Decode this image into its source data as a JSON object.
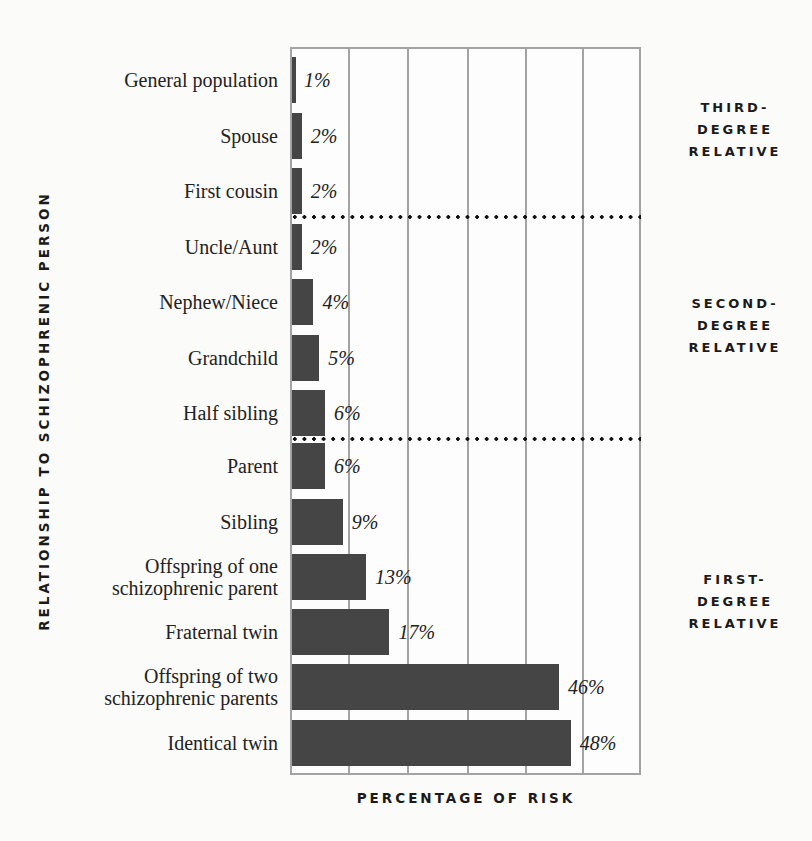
{
  "chart_data": {
    "type": "bar",
    "orientation": "horizontal",
    "title": "",
    "xlabel": "PERCENTAGE OF RISK",
    "ylabel": "RELATIONSHIP TO SCHIZOPHRENIC PERSON",
    "xlim": [
      0,
      60
    ],
    "grid": {
      "vertical": true,
      "step": 10
    },
    "categories": [
      "General population",
      "Spouse",
      "First cousin",
      "Uncle/Aunt",
      "Nephew/Niece",
      "Grandchild",
      "Half sibling",
      "Parent",
      "Sibling",
      "Offspring of one schizophrenic parent",
      "Fraternal twin",
      "Offspring of two schizophrenic parents",
      "Identical twin"
    ],
    "values": [
      1,
      2,
      2,
      2,
      4,
      5,
      6,
      6,
      9,
      13,
      17,
      46,
      48
    ],
    "value_labels": [
      "1%",
      "2%",
      "2%",
      "2%",
      "4%",
      "5%",
      "6%",
      "6%",
      "9%",
      "13%",
      "17%",
      "46%",
      "48%"
    ],
    "groups": [
      {
        "label": "THIRD-DEGREE RELATIVE",
        "categories": [
          "General population",
          "Spouse",
          "First cousin"
        ]
      },
      {
        "label": "SECOND-DEGREE RELATIVE",
        "categories": [
          "Uncle/Aunt",
          "Nephew/Niece",
          "Grandchild",
          "Half sibling"
        ]
      },
      {
        "label": "FIRST-DEGREE RELATIVE",
        "categories": [
          "Parent",
          "Sibling",
          "Offspring of one schizophrenic parent",
          "Fraternal twin",
          "Offspring of two schizophrenic parents",
          "Identical twin"
        ]
      }
    ],
    "legend": null
  },
  "axes": {
    "x_title": "PERCENTAGE OF RISK",
    "y_title": "RELATIONSHIP TO SCHIZOPHRENIC PERSON"
  },
  "rows": [
    {
      "lines": [
        "General population"
      ],
      "value": "1%"
    },
    {
      "lines": [
        "Spouse"
      ],
      "value": "2%"
    },
    {
      "lines": [
        "First cousin"
      ],
      "value": "2%"
    },
    {
      "lines": [
        "Uncle/Aunt"
      ],
      "value": "2%"
    },
    {
      "lines": [
        "Nephew/Niece"
      ],
      "value": "4%"
    },
    {
      "lines": [
        "Grandchild"
      ],
      "value": "5%"
    },
    {
      "lines": [
        "Half sibling"
      ],
      "value": "6%"
    },
    {
      "lines": [
        "Parent"
      ],
      "value": "6%"
    },
    {
      "lines": [
        "Sibling"
      ],
      "value": "9%"
    },
    {
      "lines": [
        "Offspring of one",
        "schizophrenic parent"
      ],
      "value": "13%"
    },
    {
      "lines": [
        "Fraternal twin"
      ],
      "value": "17%"
    },
    {
      "lines": [
        "Offspring of two",
        "schizophrenic parents"
      ],
      "value": "46%"
    },
    {
      "lines": [
        "Identical twin"
      ],
      "value": "48%"
    }
  ],
  "group_labels": {
    "third": [
      "THIRD-",
      "DEGREE",
      "RELATIVE"
    ],
    "second": [
      "SECOND-",
      "DEGREE",
      "RELATIVE"
    ],
    "first": [
      "FIRST-",
      "DEGREE",
      "RELATIVE"
    ]
  },
  "colors": {
    "bar": "#454545",
    "grid": "#a3a3a3",
    "divider": "#111111",
    "background": "#fbfbfa"
  }
}
